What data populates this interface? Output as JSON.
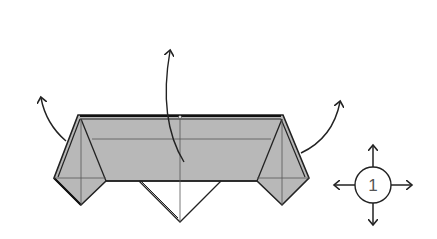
{
  "diagram": {
    "type": "origami-fold-step",
    "colors": {
      "paper_fill": "#b8b8b8",
      "outline": "#222222",
      "crease": "#555555",
      "background": "#ffffff"
    },
    "arrows": [
      {
        "name": "unfold-left-flap-arrow",
        "direction": "up-left"
      },
      {
        "name": "unfold-center-arrow",
        "direction": "up"
      },
      {
        "name": "unfold-right-flap-arrow",
        "direction": "up-right"
      }
    ],
    "symbol": {
      "name": "open-out-symbol",
      "label": "1",
      "arrows": [
        "up",
        "down",
        "left",
        "right"
      ]
    }
  }
}
